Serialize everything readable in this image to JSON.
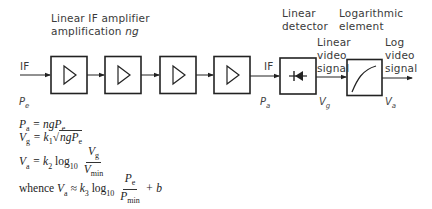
{
  "diagram": {
    "title_line1": "Linear IF amplifier",
    "title_line2_prefix": "amplification ",
    "title_line2_var": "ng",
    "input_label": "IF",
    "input_power_symbol": "P",
    "input_power_sub": "e",
    "stage_count": 4,
    "amp_output_label": "IF",
    "amp_output_power_symbol": "P",
    "amp_output_power_sub": "a",
    "detector": {
      "label_line1": "Linear",
      "label_line2": "detector",
      "output_label_line1": "Linear",
      "output_label_line2": "video",
      "output_label_line3": "signal",
      "output_symbol": "V",
      "output_sub": "g"
    },
    "log_element": {
      "label_line1": "Logarithmic",
      "label_line2": "element",
      "output_label_line1": "Log",
      "output_label_line2": "video",
      "output_label_line3": "signal",
      "output_symbol": "V",
      "output_sub": "a"
    }
  },
  "equations": {
    "eq1": {
      "lhs": "P",
      "lhs_sub": "a",
      "rhs": "= ngP",
      "rhs_sub": "e"
    },
    "eq2": {
      "lhs": "V",
      "lhs_sub": "g",
      "rhs": "= k",
      "k_sub": "1",
      "sqrt": "ngP",
      "sqrt_sub": "e"
    },
    "eq3": {
      "lhs": "V",
      "lhs_sub": "a",
      "rhs": "= k",
      "k_sub": "2",
      "log": " log",
      "log_sub": "10",
      "num": "V",
      "num_sub": "g",
      "den": "V",
      "den_sub": "min"
    },
    "eq4": {
      "prefix": "whence ",
      "lhs": "V",
      "lhs_sub": "a",
      "rhs": " ≈ k",
      "k_sub": "3",
      "log": " log",
      "log_sub": "10",
      "num": "P",
      "num_sub": "e",
      "den": "P",
      "den_sub": "min",
      "suffix": "+ b"
    }
  }
}
